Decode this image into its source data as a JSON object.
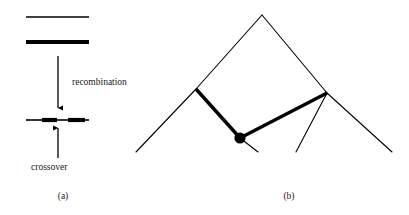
{
  "figure": {
    "title": "",
    "background_color": "#ffffff",
    "stroke_color": "#000000",
    "width": 409,
    "height": 215
  },
  "panel_a": {
    "label": "(a)",
    "label_x": 63,
    "label_y": 199,
    "annotations": {
      "recombination": {
        "text": "recombination",
        "x": 72,
        "y": 85
      },
      "crossover": {
        "text": "crossover",
        "x": 31,
        "y": 170
      }
    },
    "parent_chromosome_thin": {
      "name": "parent-chromosome-light",
      "x1": 26,
      "y1": 17,
      "x2": 89,
      "y2": 17,
      "thickness": 1.6,
      "color": "#000000"
    },
    "parent_chromosome_thick": {
      "name": "parent-chromosome-dark",
      "x1": 26,
      "y1": 42,
      "x2": 89,
      "y2": 42,
      "thickness": 4.2,
      "color": "#000000"
    },
    "arrow_recombination": {
      "name": "recombination-arrow",
      "x": 58,
      "y1": 56,
      "y2": 108,
      "direction": "down"
    },
    "arrow_crossover": {
      "name": "crossover-arrow",
      "x": 58,
      "y1": 158,
      "y2": 128,
      "direction": "up"
    },
    "recombinant_chromosome": {
      "name": "recombinant-chromosome",
      "y": 120,
      "segments": [
        {
          "x1": 26,
          "x2": 42,
          "thickness": 1.6
        },
        {
          "x1": 42,
          "x2": 57,
          "thickness": 4.2
        },
        {
          "x1": 57,
          "x2": 68,
          "thickness": 1.6
        },
        {
          "x1": 68,
          "x2": 85,
          "thickness": 4.2
        },
        {
          "x1": 85,
          "x2": 89,
          "thickness": 1.6
        }
      ]
    }
  },
  "panel_b": {
    "label": "(b)",
    "label_x": 289,
    "label_y": 199,
    "apex": {
      "x": 262,
      "y": 15
    },
    "junction_node": {
      "x": 240,
      "y": 138,
      "radius": 5.6
    },
    "right_junction": {
      "x": 327,
      "y": 93
    },
    "thin_edges": [
      {
        "name": "apex-to-left-branch",
        "x1": 262,
        "y1": 15,
        "x2": 196,
        "y2": 89
      },
      {
        "name": "apex-to-right-branch",
        "x1": 262,
        "y1": 15,
        "x2": 327,
        "y2": 93
      },
      {
        "name": "left-branch-tail",
        "x1": 196,
        "y1": 89,
        "x2": 136,
        "y2": 152
      },
      {
        "name": "right-branch-tail",
        "x1": 327,
        "y1": 93,
        "x2": 392,
        "y2": 152
      },
      {
        "name": "node-short-tail",
        "x1": 240,
        "y1": 138,
        "x2": 258,
        "y2": 152
      },
      {
        "name": "right-junction-down-tail",
        "x1": 327,
        "y1": 93,
        "x2": 296,
        "y2": 152
      }
    ],
    "thick_edges": [
      {
        "name": "left-thick-edge",
        "x1": 196,
        "y1": 89,
        "x2": 240,
        "y2": 138,
        "thickness": 3.4
      },
      {
        "name": "right-thick-edge",
        "x1": 240,
        "y1": 138,
        "x2": 327,
        "y2": 93,
        "thickness": 3.4
      }
    ]
  }
}
